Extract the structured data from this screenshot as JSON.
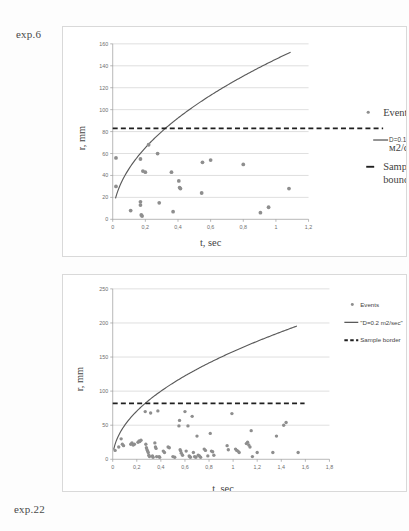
{
  "page": {
    "top_label": "exp.6",
    "bottom_label": "exp.22"
  },
  "chart_data": [
    {
      "id": "exp6",
      "type": "scatter",
      "title": "exp.6",
      "xlabel": "t, sec",
      "ylabel": "r, mm",
      "xlim": [
        0,
        1.2
      ],
      "ylim": [
        0,
        160
      ],
      "xticks": [
        "0",
        "0,2",
        "0,4",
        "0,6",
        "0,8",
        "1",
        "1,2"
      ],
      "xtick_values": [
        0,
        0.2,
        0.4,
        0.6,
        0.8,
        1.0,
        1.2
      ],
      "yticks": [
        "0",
        "20",
        "40",
        "60",
        "80",
        "100",
        "120",
        "140",
        "160"
      ],
      "ytick_values": [
        0,
        20,
        40,
        60,
        80,
        100,
        120,
        140,
        160
      ],
      "grid": true,
      "legend_position": "right",
      "legend": [
        {
          "label": "Events",
          "marker": "point",
          "color": "#8e8e8e"
        },
        {
          "label": "D=0.17 м2/сек",
          "marker": "line",
          "color": "#5a5a5a"
        },
        {
          "label": "Sample boundary",
          "marker": "dash",
          "color": "#1f1f1f"
        }
      ],
      "sample_boundary": 83,
      "diffusion_coefficient": 0.17,
      "curve_label": "D=0.17 м2/сек",
      "curve": {
        "model": "r = k*sqrt(t)",
        "k": 146,
        "t_start": 0.017,
        "t_end": 1.09
      },
      "points": [
        [
          0.02,
          56
        ],
        [
          0.02,
          30
        ],
        [
          0.11,
          8
        ],
        [
          0.17,
          55
        ],
        [
          0.17,
          16
        ],
        [
          0.17,
          13
        ],
        [
          0.175,
          4
        ],
        [
          0.18,
          3
        ],
        [
          0.185,
          44
        ],
        [
          0.2,
          43
        ],
        [
          0.22,
          68
        ],
        [
          0.275,
          60
        ],
        [
          0.285,
          15
        ],
        [
          0.36,
          43
        ],
        [
          0.37,
          7
        ],
        [
          0.405,
          35
        ],
        [
          0.41,
          29
        ],
        [
          0.415,
          28
        ],
        [
          0.545,
          24
        ],
        [
          0.55,
          52
        ],
        [
          0.6,
          54
        ],
        [
          0.8,
          50
        ],
        [
          0.905,
          6
        ],
        [
          0.955,
          11
        ],
        [
          1.08,
          28
        ]
      ]
    },
    {
      "id": "exp22",
      "type": "scatter",
      "title": "exp.22",
      "xlabel": "t, sec",
      "ylabel": "r, mm",
      "xlim": [
        0,
        1.8
      ],
      "ylim": [
        0,
        250
      ],
      "xticks": [
        "0",
        "0,2",
        "0,4",
        "0,6",
        "0,8",
        "1",
        "1,2",
        "1,4",
        "1,6",
        "1,8"
      ],
      "xtick_values": [
        0,
        0.2,
        0.4,
        0.6,
        0.8,
        1.0,
        1.2,
        1.4,
        1.6,
        1.8
      ],
      "yticks": [
        "0",
        "50",
        "100",
        "150",
        "200",
        "250"
      ],
      "ytick_values": [
        0,
        50,
        100,
        150,
        200,
        250
      ],
      "grid": true,
      "legend_position": "right",
      "legend": [
        {
          "label": "Events",
          "marker": "point",
          "color": "#8e8e8e"
        },
        {
          "label": "\"D=0.2 m2/sec\"",
          "marker": "line",
          "color": "#5a5a5a"
        },
        {
          "label": "Sample border",
          "marker": "dash",
          "color": "#1f1f1f"
        }
      ],
      "sample_boundary": 82,
      "diffusion_coefficient": 0.2,
      "curve_label": "\"D=0.2 m2/sec\"",
      "curve": {
        "model": "r = k*sqrt(t)",
        "k": 158,
        "t_start": 0.008,
        "t_end": 1.53
      },
      "points": [
        [
          0.02,
          13
        ],
        [
          0.05,
          18
        ],
        [
          0.07,
          30
        ],
        [
          0.08,
          22
        ],
        [
          0.09,
          20
        ],
        [
          0.15,
          22
        ],
        [
          0.16,
          24
        ],
        [
          0.17,
          21
        ],
        [
          0.18,
          22
        ],
        [
          0.21,
          25
        ],
        [
          0.22,
          27
        ],
        [
          0.225,
          26
        ],
        [
          0.235,
          28
        ],
        [
          0.27,
          70
        ],
        [
          0.275,
          22
        ],
        [
          0.28,
          17
        ],
        [
          0.285,
          14
        ],
        [
          0.29,
          12
        ],
        [
          0.295,
          10
        ],
        [
          0.3,
          6
        ],
        [
          0.305,
          4
        ],
        [
          0.315,
          68
        ],
        [
          0.33,
          5
        ],
        [
          0.335,
          3
        ],
        [
          0.35,
          24
        ],
        [
          0.355,
          18
        ],
        [
          0.36,
          16
        ],
        [
          0.365,
          4
        ],
        [
          0.375,
          71
        ],
        [
          0.385,
          4
        ],
        [
          0.39,
          3
        ],
        [
          0.42,
          12
        ],
        [
          0.43,
          10
        ],
        [
          0.46,
          18
        ],
        [
          0.47,
          17
        ],
        [
          0.5,
          4
        ],
        [
          0.515,
          3
        ],
        [
          0.55,
          49
        ],
        [
          0.555,
          57
        ],
        [
          0.56,
          14
        ],
        [
          0.565,
          12
        ],
        [
          0.57,
          9
        ],
        [
          0.58,
          6
        ],
        [
          0.6,
          70
        ],
        [
          0.61,
          12
        ],
        [
          0.625,
          49
        ],
        [
          0.635,
          5
        ],
        [
          0.64,
          4
        ],
        [
          0.645,
          3
        ],
        [
          0.66,
          63
        ],
        [
          0.67,
          10
        ],
        [
          0.68,
          4
        ],
        [
          0.69,
          3
        ],
        [
          0.7,
          34
        ],
        [
          0.71,
          6
        ],
        [
          0.72,
          5
        ],
        [
          0.73,
          3
        ],
        [
          0.76,
          15
        ],
        [
          0.77,
          13
        ],
        [
          0.79,
          5
        ],
        [
          0.81,
          38
        ],
        [
          0.82,
          12
        ],
        [
          0.83,
          11
        ],
        [
          0.84,
          6
        ],
        [
          0.95,
          20
        ],
        [
          0.96,
          14
        ],
        [
          0.99,
          67
        ],
        [
          1.02,
          15
        ],
        [
          1.03,
          13
        ],
        [
          1.04,
          12
        ],
        [
          1.05,
          10
        ],
        [
          1.11,
          23
        ],
        [
          1.12,
          25
        ],
        [
          1.13,
          21
        ],
        [
          1.14,
          18
        ],
        [
          1.15,
          42
        ],
        [
          1.16,
          4
        ],
        [
          1.2,
          10
        ],
        [
          1.33,
          10
        ],
        [
          1.36,
          34
        ],
        [
          1.42,
          50
        ],
        [
          1.44,
          54
        ],
        [
          1.54,
          10
        ]
      ]
    }
  ]
}
